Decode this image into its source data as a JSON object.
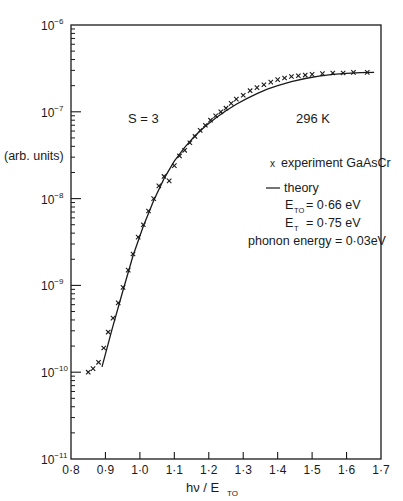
{
  "chart_data": {
    "type": "scatter",
    "title": "",
    "xlabel": "hν / E_TO",
    "ylabel": "(arb. units)",
    "xlim": [
      0.8,
      1.7
    ],
    "ylim": [
      1e-11,
      1e-06
    ],
    "yscale": "log",
    "grid": false,
    "x_ticks": [
      "0·8",
      "0·9",
      "1·0",
      "1·1",
      "1·2",
      "1·3",
      "1·4",
      "1·5",
      "1·6",
      "1·7"
    ],
    "y_ticks": [
      "10⁻¹¹",
      "10⁻¹⁰",
      "10⁻⁹",
      "10⁻⁸",
      "10⁻⁷",
      "10⁻⁶"
    ],
    "annotations": {
      "s_value": "S = 3",
      "temperature": "296 K"
    },
    "legend": {
      "experiment": "experiment GaAsCr",
      "theory": "theory",
      "params": [
        {
          "symbol": "E",
          "sub": "TO",
          "value": "= 0·66 eV"
        },
        {
          "symbol": "E",
          "sub": "T",
          "value": "= 0·75 eV"
        }
      ],
      "phonon": "phonon energy = 0·03eV"
    },
    "series": [
      {
        "name": "experiment GaAsCr",
        "marker": "x",
        "points": [
          [
            0.85,
            1e-10
          ],
          [
            0.864,
            1.1e-10
          ],
          [
            0.88,
            1.3e-10
          ],
          [
            0.895,
            1.9e-10
          ],
          [
            0.908,
            2.9e-10
          ],
          [
            0.922,
            4.2e-10
          ],
          [
            0.937,
            6.3e-10
          ],
          [
            0.951,
            9.5e-10
          ],
          [
            0.966,
            1.5e-09
          ],
          [
            0.98,
            2.3e-09
          ],
          [
            0.995,
            3.6e-09
          ],
          [
            1.01,
            5e-09
          ],
          [
            1.025,
            7.2e-09
          ],
          [
            1.04,
            1e-08
          ],
          [
            1.055,
            1.4e-08
          ],
          [
            1.07,
            1.8e-08
          ],
          [
            1.085,
            1.6e-08
          ],
          [
            1.1,
            2.4e-08
          ],
          [
            1.115,
            3.1e-08
          ],
          [
            1.13,
            3.6e-08
          ],
          [
            1.145,
            4.4e-08
          ],
          [
            1.16,
            5.2e-08
          ],
          [
            1.175,
            6.1e-08
          ],
          [
            1.19,
            7e-08
          ],
          [
            1.205,
            8e-08
          ],
          [
            1.22,
            9e-08
          ],
          [
            1.235,
            1e-07
          ],
          [
            1.25,
            1.1e-07
          ],
          [
            1.265,
            1.25e-07
          ],
          [
            1.28,
            1.4e-07
          ],
          [
            1.3,
            1.55e-07
          ],
          [
            1.32,
            1.75e-07
          ],
          [
            1.34,
            1.9e-07
          ],
          [
            1.36,
            2.05e-07
          ],
          [
            1.38,
            2.2e-07
          ],
          [
            1.4,
            2.35e-07
          ],
          [
            1.42,
            2.45e-07
          ],
          [
            1.44,
            2.55e-07
          ],
          [
            1.46,
            2.6e-07
          ],
          [
            1.48,
            2.65e-07
          ],
          [
            1.5,
            2.7e-07
          ],
          [
            1.53,
            2.75e-07
          ],
          [
            1.56,
            2.8e-07
          ],
          [
            1.59,
            2.8e-07
          ],
          [
            1.62,
            2.85e-07
          ],
          [
            1.66,
            2.85e-07
          ]
        ]
      },
      {
        "name": "theory",
        "marker": "line",
        "points": [
          [
            0.89,
            1.15e-10
          ],
          [
            0.92,
            3.2e-10
          ],
          [
            0.95,
            8.5e-10
          ],
          [
            0.98,
            2.2e-09
          ],
          [
            1.01,
            4.8e-09
          ],
          [
            1.04,
            9.5e-09
          ],
          [
            1.07,
            1.7e-08
          ],
          [
            1.1,
            2.7e-08
          ],
          [
            1.13,
            3.9e-08
          ],
          [
            1.16,
            5.3e-08
          ],
          [
            1.19,
            6.8e-08
          ],
          [
            1.22,
            8.5e-08
          ],
          [
            1.25,
            1.03e-07
          ],
          [
            1.28,
            1.22e-07
          ],
          [
            1.31,
            1.42e-07
          ],
          [
            1.34,
            1.62e-07
          ],
          [
            1.37,
            1.82e-07
          ],
          [
            1.4,
            2e-07
          ],
          [
            1.44,
            2.22e-07
          ],
          [
            1.48,
            2.42e-07
          ],
          [
            1.52,
            2.58e-07
          ],
          [
            1.56,
            2.7e-07
          ],
          [
            1.6,
            2.78e-07
          ],
          [
            1.64,
            2.83e-07
          ],
          [
            1.68,
            2.85e-07
          ]
        ]
      }
    ]
  }
}
